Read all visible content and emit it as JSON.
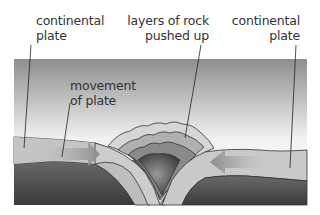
{
  "diagram": {
    "labels": {
      "left_plate": [
        "continental",
        "plate"
      ],
      "rock_layers": [
        "layers of rock",
        "pushed up"
      ],
      "right_plate": [
        "continental",
        "plate"
      ],
      "movement": [
        "movement",
        "of plate"
      ]
    },
    "colors": {
      "sky_top": "#8a8a8a",
      "sky_bottom": "#ffffff",
      "plate": "#c8c8c8",
      "mantle": "#4a4a4a",
      "arrow": "#a8a8a8",
      "leader_line": "#333333"
    }
  }
}
